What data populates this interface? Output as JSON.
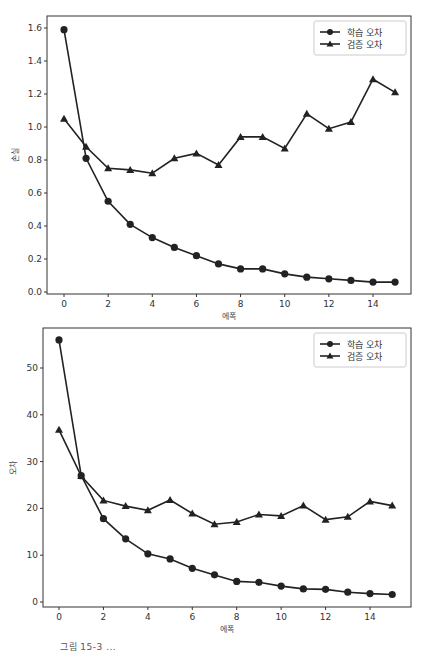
{
  "chart_data": [
    {
      "type": "line",
      "title": "",
      "xlabel": "에폭",
      "ylabel": "손실",
      "x": [
        0,
        1,
        2,
        3,
        4,
        5,
        6,
        7,
        8,
        9,
        10,
        11,
        12,
        13,
        14,
        15
      ],
      "xticks": [
        "0",
        "2",
        "4",
        "6",
        "8",
        "10",
        "12",
        "14"
      ],
      "yticks": [
        "0.0",
        "0.2",
        "0.4",
        "0.6",
        "0.8",
        "1.0",
        "1.2",
        "1.4",
        "1.6"
      ],
      "ylim": [
        0,
        1.65
      ],
      "xlim": [
        -0.7,
        15.7
      ],
      "grid": false,
      "legend_position": "upper right",
      "series": [
        {
          "name": "학습 오차",
          "marker": "circle",
          "values": [
            1.59,
            0.81,
            0.55,
            0.41,
            0.33,
            0.27,
            0.22,
            0.17,
            0.14,
            0.14,
            0.11,
            0.09,
            0.08,
            0.07,
            0.06,
            0.06
          ]
        },
        {
          "name": "검증 오차",
          "marker": "triangle",
          "values": [
            1.05,
            0.88,
            0.75,
            0.74,
            0.72,
            0.81,
            0.84,
            0.77,
            0.94,
            0.94,
            0.87,
            1.08,
            0.99,
            1.03,
            1.29,
            1.21
          ]
        }
      ]
    },
    {
      "type": "line",
      "title": "",
      "xlabel": "에폭",
      "ylabel": "오차",
      "x": [
        0,
        1,
        2,
        3,
        4,
        5,
        6,
        7,
        8,
        9,
        10,
        11,
        12,
        13,
        14,
        15
      ],
      "xticks": [
        "0",
        "2",
        "4",
        "6",
        "8",
        "10",
        "12",
        "14"
      ],
      "yticks": [
        "0",
        "10",
        "20",
        "30",
        "40",
        "50"
      ],
      "ylim": [
        -0.5,
        58
      ],
      "xlim": [
        -0.7,
        15.7
      ],
      "grid": false,
      "legend_position": "upper right",
      "series": [
        {
          "name": "학습 오차",
          "marker": "circle",
          "values": [
            56.0,
            27.0,
            17.8,
            13.5,
            10.3,
            9.2,
            7.2,
            5.8,
            4.4,
            4.2,
            3.4,
            2.8,
            2.7,
            2.1,
            1.8,
            1.6
          ]
        },
        {
          "name": "검증 오차",
          "marker": "triangle",
          "values": [
            36.8,
            26.9,
            21.7,
            20.5,
            19.6,
            21.8,
            18.9,
            16.6,
            17.1,
            18.7,
            18.4,
            20.6,
            17.6,
            18.2,
            21.5,
            20.6
          ]
        }
      ]
    }
  ],
  "caption": "그림 15-3  ...",
  "colors": {
    "line": "#222222",
    "frame": "#333333",
    "legend_border": "#cccccc"
  }
}
